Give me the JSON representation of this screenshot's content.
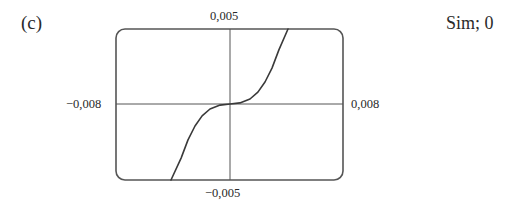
{
  "panel": {
    "label": "(c)",
    "answer": "Sim; 0"
  },
  "chart_data": {
    "type": "line",
    "title": "",
    "xlabel": "",
    "ylabel": "",
    "xlim": [
      -0.008,
      0.008
    ],
    "ylim": [
      -0.005,
      0.005
    ],
    "grid": false,
    "legend": null,
    "axes_crosshair": true,
    "tick_labels": {
      "x_min": "−0,008",
      "x_max": "0,008",
      "y_min": "−0,005",
      "y_max": "0,005"
    },
    "series": [
      {
        "name": "curve",
        "x": [
          -0.00416,
          -0.00345,
          -0.00296,
          -0.00247,
          -0.00197,
          -0.00141,
          -0.0007,
          0.0,
          0.0007,
          0.00141,
          0.00197,
          0.00247,
          0.00296,
          0.00345,
          0.00409
        ],
        "y": [
          -0.00503,
          -0.00358,
          -0.00238,
          -0.00146,
          -0.00079,
          -0.00033,
          -7e-05,
          0.0,
          7e-05,
          0.00033,
          0.00079,
          0.00146,
          0.00238,
          0.00358,
          0.00497
        ]
      }
    ]
  },
  "style": {
    "frame_color": "#555555",
    "curve_color": "#3a3a3a",
    "axis_color": "#555555"
  },
  "plot_px": {
    "frame": {
      "x": 116,
      "y": 29,
      "w": 227,
      "h": 151,
      "r": 9
    },
    "origin": {
      "x": 230,
      "y": 104
    },
    "x_scale": 14187.5,
    "y_scale": 15100
  }
}
